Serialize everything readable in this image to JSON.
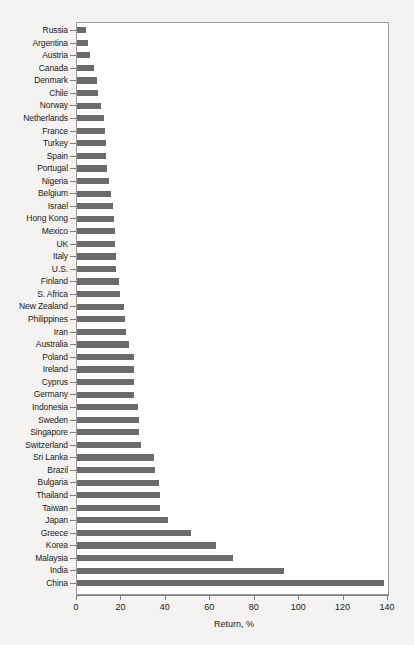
{
  "chart_data": {
    "type": "bar",
    "orientation": "horizontal",
    "title": "",
    "xlabel": "Return, %",
    "ylabel": "",
    "xlim": [
      0,
      140
    ],
    "xticks": [
      0,
      20,
      40,
      60,
      80,
      100,
      120,
      140
    ],
    "grid": false,
    "legend": false,
    "bar_color": "#6b6b6b",
    "frame_color": "#9a9a9a",
    "background": "#f4f3f1",
    "plot_background": "#ffffff",
    "categories": [
      "Russia",
      "Argentina",
      "Austria",
      "Canada",
      "Denmark",
      "Chile",
      "Norway",
      "Netherlands",
      "France",
      "Turkey",
      "Spain",
      "Portugal",
      "Nigeria",
      "Belgium",
      "Israel",
      "Hong Kong",
      "Mexico",
      "UK",
      "Italy",
      "U.S.",
      "Finland",
      "S. Africa",
      "New Zealand",
      "Philippines",
      "Iran",
      "Australia",
      "Poland",
      "Ireland",
      "Cyprus",
      "Germany",
      "Indonesia",
      "Sweden",
      "Singapore",
      "Switzerland",
      "Sri Lanka",
      "Brazil",
      "Bulgaria",
      "Thailand",
      "Taiwan",
      "Japan",
      "Greece",
      "Korea",
      "Malaysia",
      "India",
      "China"
    ],
    "values": [
      4,
      5,
      6,
      7.5,
      9,
      9.5,
      11,
      12,
      12.5,
      13,
      13,
      13.5,
      14.5,
      15.5,
      16,
      16.5,
      17,
      17,
      17.5,
      17.5,
      19,
      19.5,
      21,
      21.5,
      22,
      23.5,
      25.5,
      25.5,
      25.5,
      25.5,
      27.5,
      28,
      28,
      29,
      34.5,
      35,
      37,
      37.5,
      37.5,
      41,
      51.5,
      62.5,
      70,
      93,
      138
    ]
  }
}
